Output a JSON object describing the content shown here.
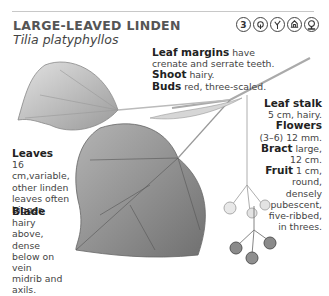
{
  "header": {
    "common_name": "LARGE-LEAVED LINDEN",
    "latin_name": "Tilia platyphyllos",
    "zone_badge": "3",
    "icons": [
      "zone-3-icon",
      "tree-crown-icon",
      "branching-icon",
      "building-icon",
      "shade-tree-icon"
    ]
  },
  "annotations": {
    "leaf_margins": {
      "label": "Leaf margins",
      "text": " have crenate and serrate teeth."
    },
    "shoot": {
      "label": "Shoot",
      "text": " hairy."
    },
    "buds": {
      "label": "Buds",
      "text": " red, three-scaled."
    },
    "leaf_stalk": {
      "label": "Leaf stalk",
      "text": "5 cm, hairy."
    },
    "flowers": {
      "label": "Flowers",
      "text": "(3–6) 12 mm."
    },
    "bract": {
      "label": "Bract",
      "text": " large, 12 cm."
    },
    "fruit": {
      "label": "Fruit",
      "text": " 1 cm, round, densely pubescent, five-ribbed, in threes."
    },
    "leaves": {
      "label": "Leaves",
      "text": "16 cm,variable, other linden leaves often bigger."
    },
    "blade": {
      "label": "Blade",
      "text": " hairy above, dense below on vein midrib and axils."
    }
  },
  "colors": {
    "text": "#444444",
    "heading": "#555555",
    "rule": "#c8c8c8",
    "leaf": "#8a8a8a"
  }
}
